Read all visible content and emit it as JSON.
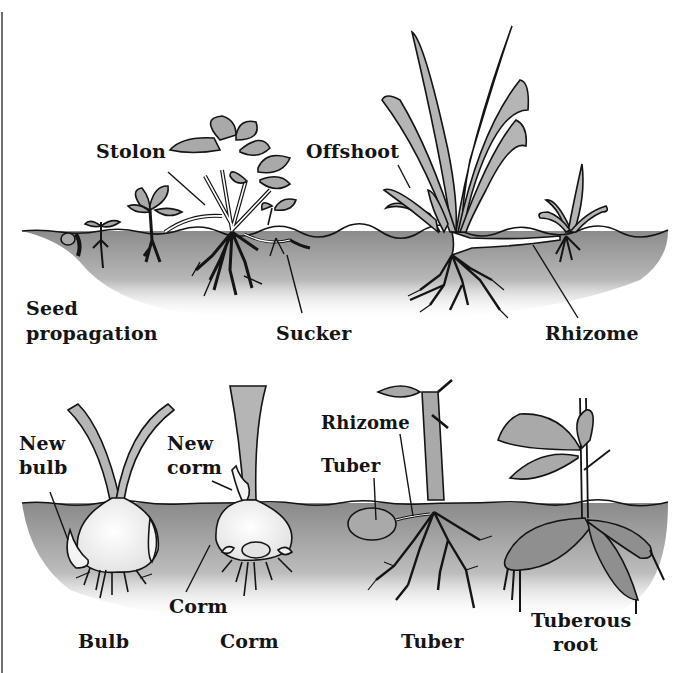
{
  "figure": {
    "colors": {
      "ink": "#141414",
      "soil_dark": "#8e8e8e",
      "soil_light": "#d9d9d9",
      "leaf_fill": "#a9a9a9",
      "pale_fill": "#f4f4f4",
      "border": "#6f6f6f"
    },
    "top_row": {
      "labels": {
        "stolon": "Stolon",
        "offshoot": "Offshoot",
        "seed_line1": "Seed",
        "seed_line2": "propagation",
        "sucker": "Sucker",
        "rhizome": "Rhizome"
      }
    },
    "bottom_row": {
      "labels": {
        "new_bulb_line1": "New",
        "new_bulb_line2": "bulb",
        "new_corm_line1": "New",
        "new_corm_line2": "corm",
        "rhizome": "Rhizome",
        "tuber_part": "Tuber",
        "corm_part": "Corm",
        "bulb": "Bulb",
        "corm": "Corm",
        "tuber": "Tuber",
        "tuberous_line1": "Tuberous",
        "tuberous_line2": "root"
      }
    }
  }
}
